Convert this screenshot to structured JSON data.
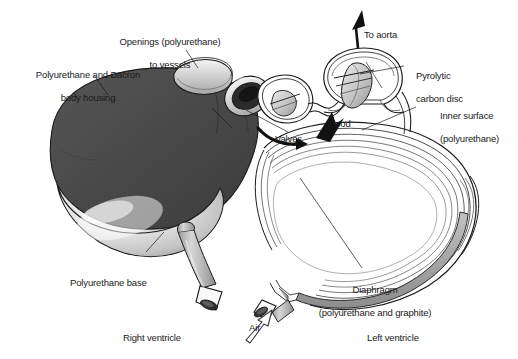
{
  "figure": {
    "type": "anatomical-illustration",
    "background_color": "#ffffff",
    "width": 518,
    "height": 359
  },
  "palette": {
    "body_housing_dark": "#4a4a4a",
    "body_housing_mid": "#5a5a5a",
    "base_light": "#d8d8d8",
    "base_highlight": "#f2f2f2",
    "tube_gray": "#b8b8b8",
    "diaphragm_gray": "#a8a8a8",
    "outline": "#1a1a1a",
    "opening_dark": "#2b2b2b",
    "label_text": "#1a1a1a",
    "arrow_solid": "#111111"
  },
  "labels": {
    "openings": {
      "line1": "Openings (polyurethane)",
      "line2": "to vessels"
    },
    "body_housing": {
      "line1": "Polyurethane and Dacron",
      "line2": "body housing"
    },
    "to_aorta": "To aorta",
    "pyrolytic_disc": {
      "line1": "Pyrolytic",
      "line2": "carbon disc"
    },
    "inner_surface": {
      "line1": "Inner surface",
      "line2": "(polyurethane)"
    },
    "blood": "Blood",
    "valves": "Valves",
    "polyurethane_base": "Polyurethane base",
    "diaphragm": {
      "line1": "Diaphragm",
      "line2": "(polyurethane and graphite)"
    },
    "air": "Air",
    "right_ventricle": "Right ventricle",
    "left_ventricle": "Left ventricle"
  },
  "arrows": {
    "to_aorta": {
      "style": "solid-black",
      "direction": "up"
    },
    "blood": {
      "style": "solid-black",
      "direction": "up-right"
    },
    "blood_curve": {
      "style": "solid-black-curved",
      "direction": "right"
    },
    "air": {
      "style": "outline-open",
      "direction": "up-right"
    }
  },
  "parts": [
    {
      "name": "right-ventricle-body",
      "material": "Polyurethane and Dacron",
      "shading": "dark stippled"
    },
    {
      "name": "polyurethane-base",
      "material": "Polyurethane",
      "shading": "light glossy"
    },
    {
      "name": "inflow-opening-cuff",
      "material": "Polyurethane",
      "shading": "light ring"
    },
    {
      "name": "outflow-opening-cuff",
      "material": "Polyurethane",
      "shading": "dark ellipse"
    },
    {
      "name": "inlet-valve-housing",
      "material": "valve",
      "shading": "outline"
    },
    {
      "name": "aortic-valve-housing",
      "material": "valve with pyrolytic carbon disc",
      "shading": "outline"
    },
    {
      "name": "left-ventricle-section",
      "material": "Inner surface polyurethane",
      "shading": "contour lines"
    },
    {
      "name": "diaphragm-band",
      "material": "polyurethane and graphite",
      "shading": "gray band"
    },
    {
      "name": "air-drive-line",
      "material": "pneumatic tube",
      "shading": "gray tube"
    },
    {
      "name": "right-ventricle-drive-line",
      "material": "pneumatic tube",
      "shading": "gray tube"
    }
  ]
}
